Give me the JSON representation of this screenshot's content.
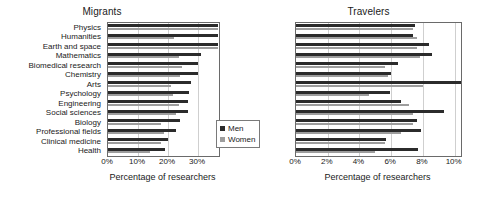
{
  "figure": {
    "legend": {
      "men_label": "Men",
      "women_label": "Women",
      "men_color": "#2b2b2b",
      "women_color": "#9d9d9d"
    }
  },
  "chart_data": [
    {
      "type": "bar",
      "orientation": "horizontal",
      "title": "Migrants",
      "xlabel": "Percentage of researchers",
      "ylabel": "",
      "xlim": [
        0,
        37
      ],
      "xticks": [
        0,
        10,
        20,
        30
      ],
      "xticklabels": [
        "0%",
        "10%",
        "20%",
        "30%"
      ],
      "grid": true,
      "legend_position": "lower right",
      "categories": [
        "Physics",
        "Humanities",
        "Earth and space",
        "Mathematics",
        "Biomedical research",
        "Chemistry",
        "Arts",
        "Psychology",
        "Engineering",
        "Social sciences",
        "Biology",
        "Professional fields",
        "Clinical medicine",
        "Health"
      ],
      "series": [
        {
          "name": "Men",
          "color": "#2b2b2b",
          "values": [
            36.5,
            36.5,
            36.5,
            31.0,
            30.0,
            30.0,
            27.5,
            27.0,
            26.5,
            26.5,
            24.0,
            22.5,
            20.0,
            19.0
          ]
        },
        {
          "name": "Women",
          "color": "#9d9d9d",
          "values": [
            36.5,
            22.0,
            36.5,
            23.5,
            24.5,
            24.0,
            21.0,
            21.5,
            23.5,
            22.5,
            17.5,
            18.5,
            17.5,
            14.0
          ]
        }
      ]
    },
    {
      "type": "bar",
      "orientation": "horizontal",
      "title": "Travelers",
      "xlabel": "Percentage of researchers",
      "ylabel": "",
      "xlim": [
        0,
        10.4
      ],
      "xticks": [
        0,
        2,
        4,
        6,
        8,
        10
      ],
      "xticklabels": [
        "0%",
        "2%",
        "4%",
        "6%",
        "8%",
        "10%"
      ],
      "grid": true,
      "legend_position": "none",
      "categories": [
        "Physics",
        "Humanities",
        "Earth and space",
        "Mathematics",
        "Biomedical research",
        "Chemistry",
        "Arts",
        "Psychology",
        "Engineering",
        "Social sciences",
        "Biology",
        "Professional fields",
        "Clinical medicine",
        "Health"
      ],
      "series": [
        {
          "name": "Men",
          "color": "#2b2b2b",
          "values": [
            7.5,
            7.4,
            8.4,
            8.6,
            6.4,
            6.0,
            10.4,
            5.9,
            6.6,
            9.3,
            7.6,
            7.9,
            5.7,
            7.7
          ]
        },
        {
          "name": "Women",
          "color": "#9d9d9d",
          "values": [
            7.4,
            7.6,
            7.6,
            7.8,
            5.6,
            5.8,
            8.0,
            4.6,
            7.1,
            7.4,
            7.4,
            6.6,
            5.6,
            5.0
          ]
        }
      ]
    }
  ]
}
